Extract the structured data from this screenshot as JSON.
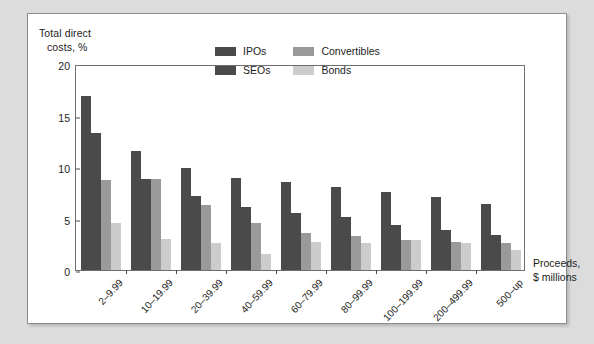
{
  "chart_data": {
    "type": "bar",
    "title": "",
    "ylabel": "Total direct costs, %",
    "xlabel": "Proceeds, $ millions",
    "ylim": [
      0,
      20
    ],
    "yticks": [
      0,
      5,
      10,
      15,
      20
    ],
    "grid": false,
    "legend_position": "upper-center",
    "categories": [
      "2–9.99",
      "10–19.99",
      "20–39.99",
      "40–59.99",
      "60–79.99",
      "80–99.99",
      "100–199.99",
      "200–499.99",
      "500–up"
    ],
    "series": [
      {
        "name": "IPOs",
        "color": "#4a4a4a",
        "values": [
          16.9,
          11.6,
          9.9,
          8.9,
          8.5,
          8.1,
          7.6,
          7.1,
          6.4
        ]
      },
      {
        "name": "SEOs",
        "color": "#4a4a4a",
        "values": [
          13.3,
          8.8,
          7.2,
          6.1,
          5.5,
          5.1,
          4.4,
          3.9,
          3.4
        ]
      },
      {
        "name": "Convertibles",
        "color": "#9a9a9a",
        "values": [
          8.7,
          8.8,
          6.3,
          4.6,
          3.6,
          3.3,
          2.9,
          2.7,
          2.6
        ]
      },
      {
        "name": "Bonds",
        "color": "#cccccc",
        "values": [
          4.6,
          3.0,
          2.6,
          1.6,
          2.7,
          2.6,
          2.9,
          2.6,
          1.9
        ]
      }
    ]
  },
  "axes": {
    "y_title_line1": "Total direct",
    "y_title_line2": "costs, %",
    "x_title_line1": "Proceeds,",
    "x_title_line2": "$ millions"
  },
  "colors": {
    "page_background": "#dcdcdc",
    "card_background": "#ffffff",
    "frame": "#6f6f6f",
    "text": "#1d1d1d",
    "ipos": "#4a4a4a",
    "seos": "#4a4a4a",
    "convertibles": "#9a9a9a",
    "bonds": "#cccccc"
  }
}
